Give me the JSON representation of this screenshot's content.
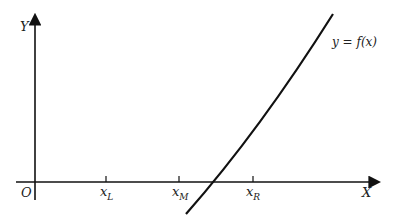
{
  "diagram": {
    "axes": {
      "y_label": "Y",
      "x_label": "X",
      "origin_label": "O"
    },
    "ticks": [
      {
        "id": "xL",
        "base": "x",
        "sub": "L"
      },
      {
        "id": "xM",
        "base": "x",
        "sub": "M"
      },
      {
        "id": "xR",
        "base": "x",
        "sub": "R"
      }
    ],
    "curve_label": "y = f(x)",
    "colors": {
      "stroke": "#111111",
      "background": "#ffffff"
    }
  }
}
